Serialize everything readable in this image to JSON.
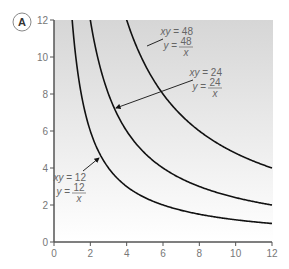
{
  "panel": {
    "label": "A"
  },
  "chart_data": {
    "type": "line",
    "title": "",
    "xlabel": "",
    "ylabel": "",
    "xlim": [
      0,
      12
    ],
    "ylim": [
      0,
      12
    ],
    "x_ticks": [
      0,
      2,
      4,
      6,
      8,
      10,
      12
    ],
    "y_ticks": [
      0,
      2,
      4,
      6,
      8,
      10,
      12
    ],
    "grid": false,
    "series": [
      {
        "name": "xy = 12",
        "equation": "y = 12/x",
        "k": 12
      },
      {
        "name": "xy = 24",
        "equation": "y = 24/x",
        "k": 24
      },
      {
        "name": "xy = 48",
        "equation": "y = 48/x",
        "k": 48
      }
    ],
    "annotations": [
      {
        "series": "xy = 48",
        "line1": "xy = 48",
        "lhs": "y =",
        "num": "48",
        "den": "x"
      },
      {
        "series": "xy = 24",
        "line1": "xy = 24",
        "lhs": "y =",
        "num": "24",
        "den": "x"
      },
      {
        "series": "xy = 12",
        "line1": "xy = 12",
        "lhs": "y =",
        "num": "12",
        "den": "x"
      }
    ]
  },
  "colors": {
    "curve": "#111111",
    "axis": "#555555",
    "shade_top": "#d6d6d6",
    "shade_bottom": "#ffffff",
    "text": "#666666"
  }
}
